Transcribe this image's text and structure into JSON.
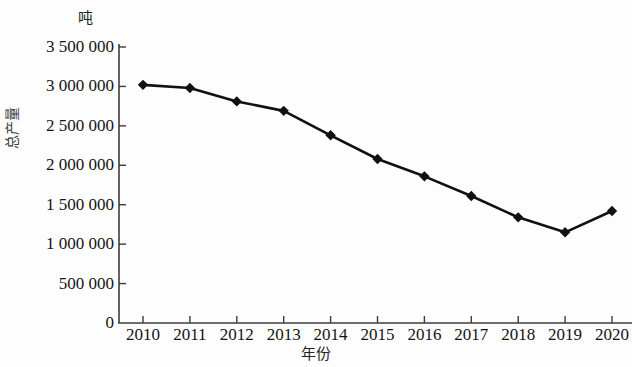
{
  "chart_data": {
    "type": "line",
    "title": "",
    "subtitle": "",
    "xlabel": "年份",
    "ylabel": "总产量",
    "unit_label": "吨",
    "categories": [
      "2010",
      "2011",
      "2012",
      "2013",
      "2014",
      "2015",
      "2016",
      "2017",
      "2018",
      "2019",
      "2020"
    ],
    "x": [
      2010,
      2011,
      2012,
      2013,
      2014,
      2015,
      2016,
      2017,
      2018,
      2019,
      2020
    ],
    "values": [
      3020000,
      2980000,
      2810000,
      2690000,
      2380000,
      2080000,
      1860000,
      1610000,
      1340000,
      1150000,
      1420000
    ],
    "series": [
      {
        "name": "总产量",
        "values": [
          3020000,
          2980000,
          2810000,
          2690000,
          2380000,
          2080000,
          1860000,
          1610000,
          1340000,
          1150000,
          1420000
        ]
      }
    ],
    "ylim": [
      0,
      3500000
    ],
    "xlim": [
      2010,
      2020
    ],
    "y_ticks": [
      0,
      500000,
      1000000,
      1500000,
      2000000,
      2500000,
      3000000,
      3500000
    ],
    "y_tick_labels": [
      "0",
      "500 000",
      "1 000 000",
      "1 500 000",
      "2 000 000",
      "2 500 000",
      "3 000 000",
      "3 500 000"
    ],
    "x_tick_labels": [
      "2010",
      "2011",
      "2012",
      "2013",
      "2014",
      "2015",
      "2016",
      "2017",
      "2018",
      "2019",
      "2020"
    ],
    "grid": false,
    "legend": null,
    "legend_position": "none",
    "marker": "diamond",
    "line_color": "#111111",
    "marker_color": "#111111",
    "axis_color": "#3c3c3c",
    "background_color": "#fdfdfd"
  },
  "axes": {
    "y_title": "总产量",
    "x_title": "年份",
    "unit": "吨"
  }
}
